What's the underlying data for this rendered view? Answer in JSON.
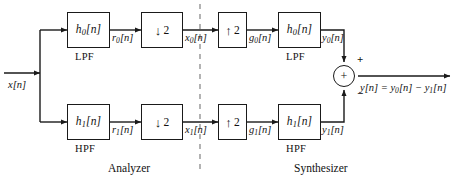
{
  "diagram": {
    "input_label": "x[n]",
    "output_label": "y[n] = y0[n] − y1[n]",
    "section_left": "Analyzer",
    "section_right": "Synthesizer",
    "divider": "dashed-vertical-separator"
  },
  "analyzer": {
    "top_branch": {
      "filter_block": "h0[n]",
      "filter_type": "LPF",
      "filter_out_label": "r0[n]",
      "rate_block_arrow": "↓",
      "rate_block_factor": "2",
      "rate_out_label": "x0[n]"
    },
    "bottom_branch": {
      "filter_block": "h1[n]",
      "filter_type": "HPF",
      "filter_out_label": "r1[n]",
      "rate_block_arrow": "↓",
      "rate_block_factor": "2",
      "rate_out_label": "x1[n]"
    }
  },
  "synthesizer": {
    "top_branch": {
      "rate_block_arrow": "↑",
      "rate_block_factor": "2",
      "rate_out_label": "g0[n]",
      "filter_block": "h0[n]",
      "filter_type": "LPF",
      "filter_out_label": "y0[n]"
    },
    "bottom_branch": {
      "rate_block_arrow": "↑",
      "rate_block_factor": "2",
      "rate_out_label": "g1[n]",
      "filter_block": "h1[n]",
      "filter_type": "HPF",
      "filter_out_label": "y1[n]"
    },
    "summer": {
      "symbol": "+",
      "top_input_sign": "+",
      "bottom_input_sign": "−"
    }
  },
  "colors": {
    "stroke": "#1a1a1a",
    "text": "#111111",
    "background": "#ffffff",
    "divider": "#8a8a8a"
  }
}
